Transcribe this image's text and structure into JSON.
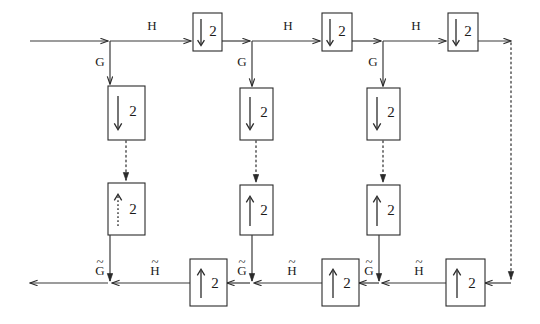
{
  "diagram": {
    "type": "block-diagram",
    "colors": {
      "line": "#3a3a3a",
      "box_stroke": "#2a2a2a",
      "text": "#1a1a1a",
      "background": "#ffffff"
    },
    "labels": {
      "analysis_lowpass": "H",
      "analysis_highpass": "G",
      "synthesis_lowpass": "H̃",
      "synthesis_highpass": "G̃",
      "decimate_factor": "2",
      "interpolate_factor": "2"
    },
    "top_row": {
      "filter_labels": [
        "H",
        "H",
        "H"
      ],
      "branch_labels": [
        "G",
        "G",
        "G"
      ],
      "downsampler_label": "2",
      "downsampler_icon": "down-arrow-icon",
      "downsamplers": [
        {
          "label": "2",
          "icon": "down-arrow-icon"
        },
        {
          "label": "2",
          "icon": "down-arrow-icon"
        },
        {
          "label": "2",
          "icon": "down-arrow-icon"
        }
      ]
    },
    "branches": [
      {
        "branch_label": "G",
        "downsampler": {
          "label": "2",
          "icon": "down-arrow-icon"
        },
        "upsampler": {
          "label": "2",
          "icon": "up-arrow-icon"
        },
        "synthesis_label": "G̃",
        "connector": "dotted"
      },
      {
        "branch_label": "G",
        "downsampler": {
          "label": "2",
          "icon": "down-arrow-icon"
        },
        "upsampler": {
          "label": "2",
          "icon": "up-arrow-icon"
        },
        "synthesis_label": "G̃",
        "connector": "dotted"
      },
      {
        "branch_label": "G",
        "downsampler": {
          "label": "2",
          "icon": "down-arrow-icon"
        },
        "upsampler": {
          "label": "2",
          "icon": "up-arrow-icon"
        },
        "synthesis_label": "G̃",
        "connector": "dotted"
      }
    ],
    "bottom_row": {
      "filter_labels": [
        "H̃",
        "H̃",
        "H̃"
      ],
      "branch_labels": [
        "G̃",
        "G̃",
        "G̃"
      ],
      "upsampler_label": "2",
      "upsampler_icon": "up-arrow-icon",
      "upsamplers": [
        {
          "label": "2",
          "icon": "up-arrow-icon"
        },
        {
          "label": "2",
          "icon": "up-arrow-icon"
        },
        {
          "label": "2",
          "icon": "up-arrow-icon"
        }
      ]
    },
    "right_link": {
      "connector": "dotted",
      "description": "coarsest-scale dotted connection from analysis output to synthesis input"
    }
  }
}
